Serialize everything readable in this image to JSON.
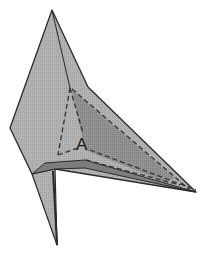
{
  "figure": {
    "label": "A",
    "colors": {
      "paper_light": "#b8b8b8",
      "paper_mid": "#a6a6a6",
      "paper_dark": "#8c8c8c",
      "paper_darker": "#7a7a7a",
      "edge": "#2a2a2a",
      "dash": "#333333"
    },
    "vertices": {
      "top_peak": [
        52,
        10
      ],
      "left_point": [
        10,
        128
      ],
      "notch": [
        88,
        87
      ],
      "inner_apex": [
        70,
        88
      ],
      "right_tip": [
        196,
        192
      ],
      "fold_left": [
        32,
        174
      ],
      "fold_mid": [
        55,
        169
      ],
      "bottom_tip": [
        57,
        245
      ]
    }
  },
  "caption": {
    "text": "",
    "note": "cut off at bottom edge"
  }
}
